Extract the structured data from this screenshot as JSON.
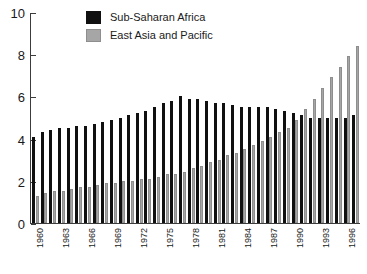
{
  "chart_data": {
    "type": "bar",
    "title": "",
    "subtitle": "",
    "xlabel": "",
    "ylabel": "",
    "ylim": [
      0,
      10
    ],
    "yticks": [
      0,
      2,
      4,
      6,
      8,
      10
    ],
    "grid": false,
    "legend_position": "top-center",
    "bar_layout": "grouped",
    "categories": [
      "1960",
      "1961",
      "1962",
      "1963",
      "1964",
      "1965",
      "1966",
      "1967",
      "1968",
      "1969",
      "1970",
      "1971",
      "1972",
      "1973",
      "1974",
      "1975",
      "1976",
      "1977",
      "1978",
      "1979",
      "1980",
      "1981",
      "1982",
      "1983",
      "1984",
      "1985",
      "1986",
      "1987",
      "1988",
      "1989",
      "1990",
      "1991",
      "1992",
      "1993",
      "1994",
      "1995",
      "1996",
      "1997"
    ],
    "tick_labels": [
      "1960",
      "",
      "",
      "1963",
      "",
      "",
      "1966",
      "",
      "",
      "1969",
      "",
      "",
      "1972",
      "",
      "",
      "1975",
      "",
      "",
      "1978",
      "",
      "",
      "1981",
      "",
      "",
      "1984",
      "",
      "",
      "1987",
      "",
      "",
      "1990",
      "",
      "",
      "1993",
      "",
      "",
      "1996",
      ""
    ],
    "series": [
      {
        "name": "Sub-Saharan Africa",
        "color": "#101010",
        "values": [
          4.1,
          4.3,
          4.4,
          4.5,
          4.5,
          4.6,
          4.6,
          4.7,
          4.8,
          4.9,
          5.0,
          5.1,
          5.2,
          5.3,
          5.5,
          5.7,
          5.8,
          6.0,
          5.9,
          5.9,
          5.8,
          5.7,
          5.7,
          5.6,
          5.5,
          5.5,
          5.5,
          5.5,
          5.4,
          5.3,
          5.2,
          5.1,
          5.0,
          5.0,
          5.0,
          5.0,
          5.0,
          5.1
        ]
      },
      {
        "name": "East Asia and Pacific",
        "color": "#a6a6a6",
        "values": [
          1.3,
          1.4,
          1.5,
          1.5,
          1.6,
          1.7,
          1.7,
          1.8,
          1.9,
          1.9,
          2.0,
          2.0,
          2.1,
          2.1,
          2.2,
          2.3,
          2.3,
          2.4,
          2.6,
          2.7,
          2.9,
          3.0,
          3.2,
          3.3,
          3.5,
          3.7,
          3.9,
          4.1,
          4.3,
          4.5,
          4.9,
          5.4,
          5.9,
          6.4,
          6.9,
          7.4,
          7.9,
          8.4
        ]
      }
    ]
  },
  "legend": {
    "items": [
      {
        "label": "Sub-Saharan Africa",
        "swatch": "black-swatch-icon"
      },
      {
        "label": "East Asia and Pacific",
        "swatch": "gray-swatch-icon"
      }
    ]
  }
}
